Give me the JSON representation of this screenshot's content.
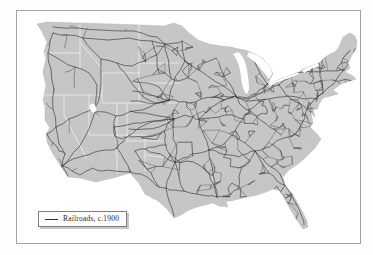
{
  "map": {
    "kind": "reference-map",
    "region": "Contiguous United States",
    "depicts": "Railroad network density, circa 1900 (dense in the East, sparse trunk lines in the West)"
  },
  "legend": {
    "items": [
      {
        "symbol": "railroad-line",
        "label": "Railroads, c.1900"
      }
    ]
  },
  "colors": {
    "background": "#ffffff",
    "frame_border": "#a3a3a3",
    "land": "#c6c6c6",
    "coast": "#adadad",
    "railroad": "#474747",
    "trunk_railroad": "#3d3d3d",
    "state_border": "#f2f2f2",
    "water": "#ffffff",
    "legend_text": "#1f1f1f"
  }
}
